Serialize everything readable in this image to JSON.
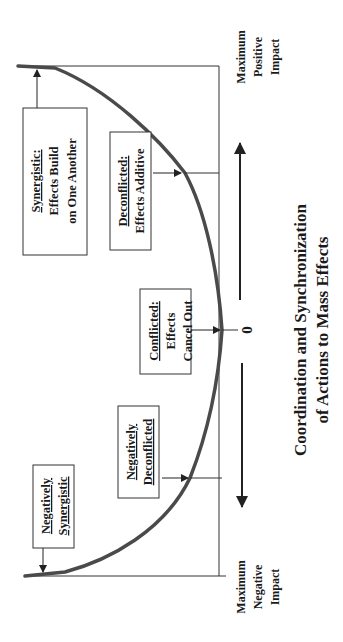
{
  "title": {
    "line1": "Coordination and Synchronization",
    "line2": "of Actions to Mass Effects"
  },
  "axis": {
    "zero_label": "0",
    "positive_end": [
      "Maximum",
      "Positive",
      "Impact"
    ],
    "negative_end": [
      "Maximum",
      "Negative",
      "Impact"
    ]
  },
  "boxes": {
    "synergistic": {
      "heading": "Synergistic:",
      "lines": [
        "Effects Build",
        "on One Another"
      ]
    },
    "deconflicted": {
      "heading": "Deconflicted:",
      "lines": [
        "Effects Additive"
      ]
    },
    "conflicted": {
      "heading": "Conflicted:",
      "lines": [
        "Effects",
        "Cancel Out"
      ]
    },
    "negatively_deconflicted": {
      "heading": "Negatively",
      "lines": [
        "Deconflicted"
      ]
    },
    "negatively_synergistic": {
      "heading": "Negatively",
      "lines": [
        "Synergistic"
      ]
    }
  },
  "colors": {
    "curve": "#4a4a4a",
    "lines": "#333333",
    "background": "#ffffff"
  }
}
